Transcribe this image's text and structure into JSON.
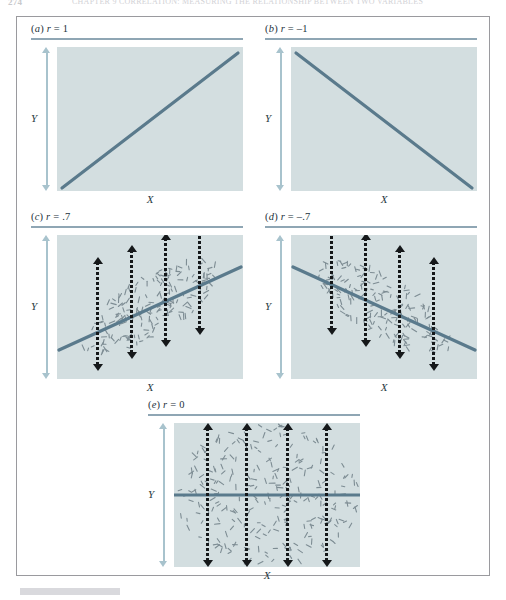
{
  "running_header": {
    "page_number": "274",
    "text": "CHAPTER 9  CORRELATION: MEASURING THE RELATIONSHIP BETWEEN TWO VARIABLES"
  },
  "figure": {
    "axis_labels": {
      "x": "X",
      "y": "Y"
    },
    "colors": {
      "plot_background": "#d3dee0",
      "regression_line": "#5a7a8c",
      "rule": "#8fa6b4",
      "y_axis_arrow": "#a8c3cd",
      "measure_arrow": "#15181a",
      "frame_border": "#9a9a9e",
      "scatter_dash": "#7d8c93"
    },
    "panels": [
      {
        "id": "a",
        "label": "(a) r = 1",
        "label_letter": "a",
        "label_text": "r = 1",
        "r_value": "1",
        "pattern": "perfect-positive-line",
        "arrow_count": 0
      },
      {
        "id": "b",
        "label": "(b) r = –1",
        "label_letter": "b",
        "label_text": "r = –1",
        "r_value": "–1",
        "pattern": "perfect-negative-line",
        "arrow_count": 0
      },
      {
        "id": "c",
        "label": "(c) r = .7",
        "label_letter": "c",
        "label_text": "r = .7",
        "r_value": ".7",
        "pattern": "positive-ellipse-scatter",
        "arrow_count": 4
      },
      {
        "id": "d",
        "label": "(d) r = –.7",
        "label_letter": "d",
        "label_text": "r = –.7",
        "r_value": "–.7",
        "pattern": "negative-ellipse-scatter",
        "arrow_count": 4
      },
      {
        "id": "e",
        "label": "(e) r = 0",
        "label_letter": "e",
        "label_text": "r = 0",
        "r_value": "0",
        "pattern": "uniform-scatter-flat-line",
        "arrow_count": 4
      }
    ]
  },
  "chart_data": {
    "type": "scatter",
    "title": "",
    "xlabel": "X",
    "ylabel": "Y",
    "grid": false,
    "legend": "none",
    "panels": [
      {
        "id": "a",
        "label": "(a) r = 1",
        "r": 1,
        "line": {
          "x0": 0.03,
          "y0": 0.02,
          "x1": 0.97,
          "y1": 0.96
        },
        "scatter_points": 0,
        "measure_arrows": []
      },
      {
        "id": "b",
        "label": "(b) r = –1",
        "r": -1,
        "line": {
          "x0": 0.03,
          "y0": 0.96,
          "x1": 0.97,
          "y1": 0.02
        },
        "scatter_points": 0,
        "measure_arrows": []
      },
      {
        "id": "c",
        "label": "(c) r = .7",
        "r": 0.7,
        "line": {
          "x0": 0.02,
          "y0": 0.22,
          "x1": 0.98,
          "y1": 0.8
        },
        "scatter_points": 170,
        "cloud": {
          "cx": 0.5,
          "cy": 0.5,
          "rx": 0.42,
          "ry": 0.2,
          "tilt_deg": -31
        },
        "measure_arrows": [
          {
            "x": 0.22,
            "center_y": 0.35,
            "half_height": 0.4
          },
          {
            "x": 0.4,
            "center_y": 0.46,
            "half_height": 0.4
          },
          {
            "x": 0.58,
            "center_y": 0.57,
            "half_height": 0.4
          },
          {
            "x": 0.76,
            "center_y": 0.68,
            "half_height": 0.4
          }
        ]
      },
      {
        "id": "d",
        "label": "(d) r = –.7",
        "r": -0.7,
        "line": {
          "x0": 0.02,
          "y0": 0.8,
          "x1": 0.98,
          "y1": 0.2
        },
        "scatter_points": 170,
        "cloud": {
          "cx": 0.5,
          "cy": 0.5,
          "rx": 0.42,
          "ry": 0.2,
          "tilt_deg": 31
        },
        "measure_arrows": [
          {
            "x": 0.22,
            "center_y": 0.68,
            "half_height": 0.4
          },
          {
            "x": 0.4,
            "center_y": 0.57,
            "half_height": 0.4
          },
          {
            "x": 0.58,
            "center_y": 0.45,
            "half_height": 0.4
          },
          {
            "x": 0.76,
            "center_y": 0.34,
            "half_height": 0.4
          }
        ]
      },
      {
        "id": "e",
        "label": "(e) r = 0",
        "r": 0,
        "line": {
          "x0": 0.0,
          "y0": 0.5,
          "x1": 1.0,
          "y1": 0.5
        },
        "scatter_points": 260,
        "cloud": {
          "cx": 0.5,
          "cy": 0.5,
          "rx": 0.5,
          "ry": 0.5,
          "tilt_deg": 0
        },
        "measure_arrows": [
          {
            "x": 0.18,
            "center_y": 0.5,
            "half_height": 0.5
          },
          {
            "x": 0.39,
            "center_y": 0.5,
            "half_height": 0.5
          },
          {
            "x": 0.61,
            "center_y": 0.5,
            "half_height": 0.5
          },
          {
            "x": 0.82,
            "center_y": 0.5,
            "half_height": 0.5
          }
        ]
      }
    ]
  }
}
